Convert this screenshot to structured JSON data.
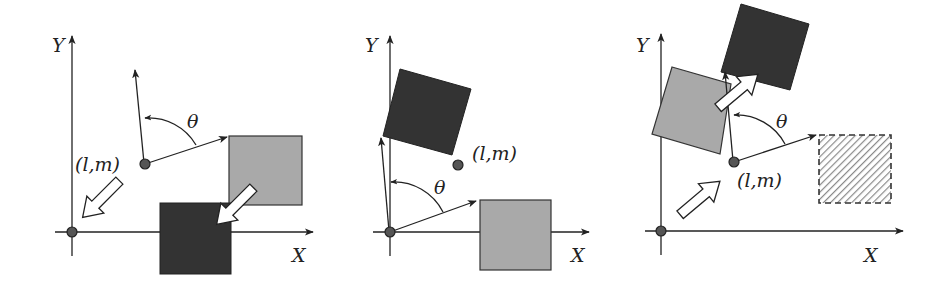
{
  "diagram": {
    "colors": {
      "background": "#ffffff",
      "stroke": "#222222",
      "light_square": "#a9a9a9",
      "dark_square": "#333333",
      "point": "#444444",
      "hatch": "#8a8a8a"
    },
    "panels": [
      {
        "id": "panel-1",
        "axis_x_label": "X",
        "axis_y_label": "Y",
        "point_label": "(l,m)",
        "angle_label": "θ",
        "elements": [
          "light-square",
          "dark-square",
          "translation-arrow-to-origin",
          "translation-arrow-square"
        ]
      },
      {
        "id": "panel-2",
        "axis_x_label": "X",
        "axis_y_label": "Y",
        "point_label": "(l,m)",
        "angle_label": "θ",
        "elements": [
          "light-square",
          "rotated-dark-square"
        ]
      },
      {
        "id": "panel-3",
        "axis_x_label": "X",
        "axis_y_label": "Y",
        "point_label": "(l,m)",
        "angle_label": "θ",
        "elements": [
          "rotated-light-square",
          "rotated-dark-square",
          "hatched-dashed-square",
          "translation-arrow-from-origin",
          "translation-arrow-square"
        ]
      }
    ]
  }
}
